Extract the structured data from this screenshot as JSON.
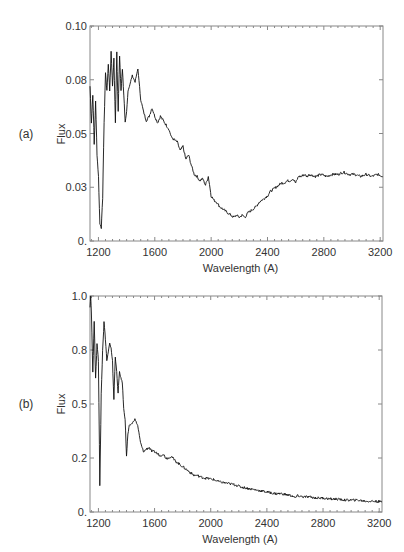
{
  "chart_data": [
    {
      "type": "line",
      "panel_label": "(a)",
      "title": "",
      "xlabel": "Wavelength (A)",
      "ylabel": "Flux",
      "xlim": [
        1140,
        3220
      ],
      "ylim": [
        0,
        0.1
      ],
      "grid": false,
      "legend": null,
      "xticks": [
        1200,
        1600,
        2000,
        2400,
        2800,
        3200
      ],
      "xtick_labels": [
        "1200",
        "1600",
        "2000",
        "2400",
        "2800",
        "3200"
      ],
      "yticks": [
        0,
        0.025,
        0.05,
        0.075,
        0.1
      ],
      "ytick_labels": [
        "0.",
        "0.03",
        "0.05",
        "0.08",
        "0.10"
      ],
      "series": [
        {
          "name": "spectrum a",
          "x": [
            1140,
            1150,
            1160,
            1170,
            1180,
            1190,
            1200,
            1210,
            1220,
            1230,
            1240,
            1250,
            1260,
            1270,
            1280,
            1290,
            1300,
            1310,
            1320,
            1330,
            1340,
            1350,
            1360,
            1370,
            1380,
            1390,
            1400,
            1410,
            1420,
            1440,
            1460,
            1480,
            1500,
            1520,
            1540,
            1560,
            1580,
            1600,
            1620,
            1640,
            1660,
            1680,
            1700,
            1720,
            1740,
            1760,
            1780,
            1800,
            1820,
            1840,
            1860,
            1880,
            1900,
            1920,
            1940,
            1960,
            1980,
            2000,
            2020,
            2040,
            2060,
            2080,
            2100,
            2120,
            2140,
            2160,
            2180,
            2200,
            2220,
            2240,
            2260,
            2280,
            2300,
            2320,
            2340,
            2360,
            2380,
            2400,
            2420,
            2440,
            2460,
            2480,
            2500,
            2520,
            2540,
            2560,
            2580,
            2600,
            2620,
            2640,
            2660,
            2680,
            2700,
            2740,
            2780,
            2820,
            2860,
            2900,
            2940,
            2980,
            3020,
            3060,
            3100,
            3140,
            3180,
            3220
          ],
          "values": [
            0.072,
            0.055,
            0.068,
            0.045,
            0.065,
            0.04,
            0.03,
            0.008,
            0.006,
            0.02,
            0.055,
            0.078,
            0.07,
            0.082,
            0.07,
            0.088,
            0.072,
            0.085,
            0.055,
            0.088,
            0.06,
            0.086,
            0.07,
            0.08,
            0.068,
            0.055,
            0.06,
            0.07,
            0.072,
            0.077,
            0.074,
            0.08,
            0.066,
            0.06,
            0.056,
            0.058,
            0.062,
            0.058,
            0.055,
            0.058,
            0.056,
            0.054,
            0.052,
            0.048,
            0.047,
            0.046,
            0.042,
            0.044,
            0.038,
            0.04,
            0.035,
            0.031,
            0.03,
            0.028,
            0.029,
            0.026,
            0.03,
            0.021,
            0.019,
            0.018,
            0.016,
            0.015,
            0.014,
            0.013,
            0.012,
            0.011,
            0.012,
            0.011,
            0.012,
            0.011,
            0.013,
            0.014,
            0.015,
            0.016,
            0.018,
            0.019,
            0.02,
            0.021,
            0.023,
            0.024,
            0.025,
            0.026,
            0.027,
            0.027,
            0.028,
            0.028,
            0.029,
            0.027,
            0.03,
            0.03,
            0.031,
            0.03,
            0.031,
            0.03,
            0.031,
            0.03,
            0.031,
            0.031,
            0.032,
            0.031,
            0.031,
            0.03,
            0.031,
            0.03,
            0.031,
            0.03
          ]
        }
      ]
    },
    {
      "type": "line",
      "panel_label": "(b)",
      "title": "",
      "xlabel": "Wavelength (A)",
      "ylabel": "Flux",
      "xlim": [
        1140,
        3220
      ],
      "ylim": [
        0,
        1.0
      ],
      "grid": false,
      "legend": null,
      "xticks": [
        1200,
        1600,
        2000,
        2400,
        2800,
        3200
      ],
      "xtick_labels": [
        "1200",
        "1600",
        "2000",
        "2400",
        "2800",
        "3200"
      ],
      "yticks": [
        0,
        0.25,
        0.5,
        0.75,
        1.0
      ],
      "ytick_labels": [
        "0.",
        "0.2",
        "0.5",
        "0.8",
        "1.0"
      ],
      "series": [
        {
          "name": "spectrum b",
          "x": [
            1140,
            1145,
            1150,
            1160,
            1170,
            1180,
            1190,
            1200,
            1210,
            1220,
            1230,
            1240,
            1250,
            1260,
            1270,
            1280,
            1290,
            1300,
            1310,
            1320,
            1330,
            1340,
            1350,
            1360,
            1370,
            1380,
            1390,
            1400,
            1410,
            1420,
            1440,
            1460,
            1480,
            1500,
            1520,
            1540,
            1560,
            1580,
            1600,
            1620,
            1640,
            1660,
            1680,
            1700,
            1720,
            1740,
            1760,
            1780,
            1800,
            1820,
            1840,
            1860,
            1880,
            1900,
            1940,
            1980,
            2020,
            2060,
            2100,
            2140,
            2180,
            2220,
            2260,
            2300,
            2340,
            2380,
            2420,
            2460,
            2500,
            2540,
            2580,
            2600,
            2620,
            2660,
            2700,
            2750,
            2800,
            2850,
            2900,
            2950,
            3000,
            3050,
            3100,
            3150,
            3200,
            3220
          ],
          "values": [
            0.95,
            1.0,
            0.92,
            0.65,
            0.88,
            0.62,
            0.78,
            0.7,
            0.12,
            0.55,
            0.75,
            0.88,
            0.8,
            0.7,
            0.74,
            0.78,
            0.76,
            0.7,
            0.52,
            0.72,
            0.65,
            0.55,
            0.65,
            0.62,
            0.6,
            0.48,
            0.43,
            0.26,
            0.36,
            0.4,
            0.41,
            0.43,
            0.4,
            0.32,
            0.28,
            0.29,
            0.3,
            0.28,
            0.28,
            0.27,
            0.26,
            0.27,
            0.25,
            0.25,
            0.26,
            0.24,
            0.23,
            0.22,
            0.21,
            0.2,
            0.19,
            0.18,
            0.17,
            0.17,
            0.16,
            0.155,
            0.15,
            0.14,
            0.135,
            0.13,
            0.125,
            0.115,
            0.11,
            0.105,
            0.1,
            0.095,
            0.09,
            0.085,
            0.085,
            0.08,
            0.075,
            0.065,
            0.075,
            0.07,
            0.07,
            0.065,
            0.065,
            0.06,
            0.06,
            0.055,
            0.055,
            0.055,
            0.05,
            0.05,
            0.048,
            0.046
          ]
        }
      ]
    }
  ]
}
